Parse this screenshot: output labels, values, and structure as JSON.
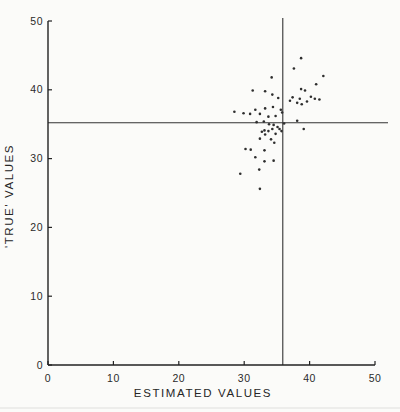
{
  "figure": {
    "background": "#fbfbf9",
    "ink": "#222222",
    "point_color": "#2e2e2e",
    "tick_label_color": "#2a2a2a"
  },
  "chart_data": {
    "type": "scatter",
    "title": "",
    "xlabel": "ESTIMATED VALUES",
    "ylabel": "'TRUE' VALUES",
    "xlim": [
      0,
      50
    ],
    "ylim": [
      0,
      50
    ],
    "xticks": [
      0,
      10,
      20,
      30,
      40,
      50
    ],
    "yticks": [
      0,
      10,
      20,
      30,
      40,
      50
    ],
    "grid": false,
    "legend": "none",
    "reference_lines": {
      "vertical_x": 35.9,
      "horizontal_y": 35.2
    },
    "points": [
      [
        38.7,
        44.6
      ],
      [
        37.6,
        43.1
      ],
      [
        42.1,
        42.0
      ],
      [
        34.2,
        41.8
      ],
      [
        41.0,
        40.8
      ],
      [
        31.3,
        39.9
      ],
      [
        33.2,
        39.8
      ],
      [
        39.3,
        39.9
      ],
      [
        38.7,
        40.1
      ],
      [
        35.2,
        38.8
      ],
      [
        34.3,
        39.3
      ],
      [
        37.4,
        38.9
      ],
      [
        38.5,
        38.7
      ],
      [
        40.2,
        39.0
      ],
      [
        40.8,
        38.7
      ],
      [
        41.5,
        38.6
      ],
      [
        39.6,
        38.3
      ],
      [
        38.1,
        38.1
      ],
      [
        38.8,
        37.9
      ],
      [
        37.0,
        38.4
      ],
      [
        35.6,
        37.1
      ],
      [
        31.7,
        37.1
      ],
      [
        28.5,
        36.8
      ],
      [
        29.9,
        36.6
      ],
      [
        30.9,
        36.5
      ],
      [
        32.4,
        36.5
      ],
      [
        33.7,
        36.1
      ],
      [
        33.2,
        37.3
      ],
      [
        34.4,
        37.5
      ],
      [
        34.8,
        36.2
      ],
      [
        35.8,
        36.7
      ],
      [
        33.0,
        35.4
      ],
      [
        31.9,
        35.3
      ],
      [
        38.1,
        35.5
      ],
      [
        36.1,
        35.1
      ],
      [
        33.8,
        35.0
      ],
      [
        34.5,
        34.9
      ],
      [
        34.3,
        34.3
      ],
      [
        35.1,
        34.6
      ],
      [
        35.4,
        34.3
      ],
      [
        35.7,
        34.0
      ],
      [
        33.1,
        34.1
      ],
      [
        33.7,
        34.0
      ],
      [
        32.7,
        33.9
      ],
      [
        33.2,
        33.5
      ],
      [
        34.8,
        33.6
      ],
      [
        32.4,
        32.9
      ],
      [
        34.1,
        32.8
      ],
      [
        34.6,
        32.3
      ],
      [
        30.2,
        31.4
      ],
      [
        31.0,
        31.3
      ],
      [
        33.1,
        31.2
      ],
      [
        31.7,
        30.2
      ],
      [
        33.1,
        29.6
      ],
      [
        34.5,
        29.7
      ],
      [
        32.3,
        28.4
      ],
      [
        29.4,
        27.8
      ],
      [
        32.4,
        25.6
      ],
      [
        39.1,
        34.3
      ]
    ]
  }
}
